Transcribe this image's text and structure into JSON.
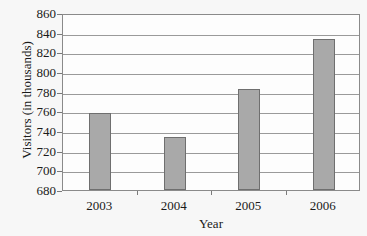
{
  "chart_data": {
    "type": "bar",
    "title": "",
    "xlabel": "Year",
    "ylabel": "Visitors (in thousands)",
    "categories": [
      "2003",
      "2004",
      "2005",
      "2006"
    ],
    "values": [
      758,
      734,
      783,
      834
    ],
    "ylim": [
      680,
      860
    ],
    "ytick_step": 20,
    "yticks": [
      "860",
      "840",
      "820",
      "800",
      "780",
      "760",
      "740",
      "720",
      "700",
      "680"
    ],
    "grid": true,
    "legend": false,
    "bar_color": "#a9a9a9",
    "bar_border_color": "#6f6f6f",
    "grid_color": "#9a9a9a",
    "frame_color": "#8a8a8a",
    "background_color": "#f7f7f7",
    "plot_background_color": "#fdfdfd",
    "text_color": "#1a1a1a"
  }
}
